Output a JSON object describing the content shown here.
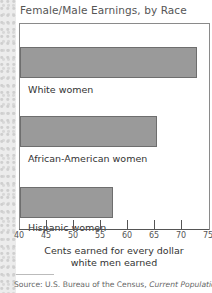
{
  "title": "Female/Male Earnings, by Race",
  "source_prefix": "Source: U.S. Bureau of the Census,",
  "source_italic": "Current Population",
  "chart_data": {
    "type": "bar",
    "orientation": "horizontal",
    "title": "Female/Male Earnings, by Race",
    "categories": [
      "White women",
      "African-American women",
      "Hispanic women"
    ],
    "values": [
      72.8,
      65.4,
      57.3
    ],
    "xlabel": "Cents earned for every dollar white men earned",
    "xlabel_lines": [
      "Cents earned for every dollar",
      "white men earned"
    ],
    "ylabel": "",
    "xlim": [
      40,
      75
    ],
    "xticks": [
      40,
      45,
      50,
      55,
      60,
      65,
      70,
      75
    ],
    "grid": false,
    "legend": null,
    "bar_color": "#9a9a9a",
    "source": "Source: U.S. Bureau of the Census, Current Population"
  }
}
